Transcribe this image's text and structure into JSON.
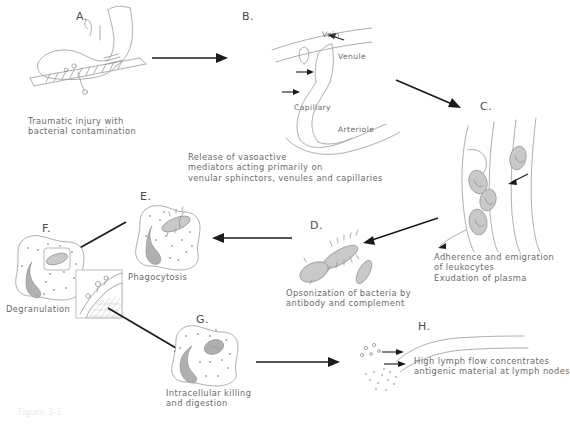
{
  "figure": {
    "type": "flow-diagram",
    "title_caption": "Figure 3-1",
    "panels": [
      {
        "id": "A",
        "letter": "A.",
        "caption": "Traumatic injury with\nbacterial contamination",
        "illustration": "foot-with-splinter-and-bacteria"
      },
      {
        "id": "B",
        "letter": "B.",
        "caption": "Release of vasoactive\nmediators acting primarily on\nvenular sphinctors, venules and capillaries",
        "illustration": "microcirculation-vessels",
        "vessel_labels": [
          "Vein",
          "Venule",
          "Capillary",
          "Arteriole"
        ]
      },
      {
        "id": "C",
        "letter": "C.",
        "caption": "Adherence and emigration\nof leukocytes\nExudation of plasma",
        "illustration": "leukocyte-margination-in-venule"
      },
      {
        "id": "D",
        "letter": "D.",
        "caption": "Opsonization of bacteria by\nantibody and complement",
        "illustration": "opsonized-bacteria"
      },
      {
        "id": "E",
        "letter": "E.",
        "caption": "Phagocytosis",
        "illustration": "neutrophil-engulfing-bacterium"
      },
      {
        "id": "F",
        "letter": "F.",
        "caption": "Degranulation",
        "illustration": "neutrophil-degranulating-with-inset-detail"
      },
      {
        "id": "G",
        "letter": "G.",
        "caption": "Intracellular killing\nand digestion",
        "illustration": "neutrophil-digesting-bacterium"
      },
      {
        "id": "H",
        "letter": "H.",
        "caption": "High lymph flow concentrates\nantigenic material at lymph nodes",
        "illustration": "lymphatic-vessel-with-antigen"
      }
    ],
    "arrows": [
      {
        "name": "arrow-a-to-b",
        "from": "A",
        "to": "B"
      },
      {
        "name": "arrow-b-to-c",
        "from": "B",
        "to": "C"
      },
      {
        "name": "arrow-c-to-d",
        "from": "C",
        "to": "D"
      },
      {
        "name": "arrow-d-to-e",
        "from": "D",
        "to": "E"
      },
      {
        "name": "arrow-e-to-f",
        "from": "E",
        "to": "F"
      },
      {
        "name": "arrow-f-to-g",
        "from": "F",
        "to": "G"
      },
      {
        "name": "arrow-g-to-h",
        "from": "G",
        "to": "H"
      }
    ],
    "colors": {
      "background": "#ffffff",
      "line_art": "#9a9a9a",
      "arrow": "#1a1a1a",
      "text": "#6a6a6a",
      "bacteria_fill": "#c9c9c9"
    }
  }
}
